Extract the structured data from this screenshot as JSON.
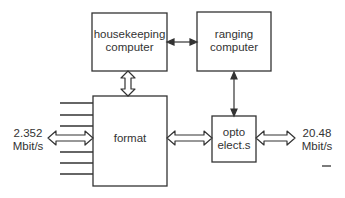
{
  "diagram": {
    "blocks": {
      "housekeeping": {
        "line1": "housekeeping",
        "line2": "computer"
      },
      "ranging": {
        "line1": "ranging",
        "line2": "computer"
      },
      "format": {
        "label": "format"
      },
      "opto": {
        "line1": "opto",
        "line2": "elect.s"
      }
    },
    "rates": {
      "input": {
        "line1": "2.352",
        "line2": "Mbit/s"
      },
      "output": {
        "line1": "20.48",
        "line2": "Mbit/s"
      }
    },
    "input_lines_count": 6,
    "colors": {
      "stroke": "#333333",
      "background": "#ffffff"
    }
  }
}
